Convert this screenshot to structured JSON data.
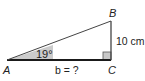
{
  "diagram": {
    "type": "right-triangle",
    "vertices": {
      "A": {
        "label": "A"
      },
      "B": {
        "label": "B"
      },
      "C": {
        "label": "C"
      }
    },
    "angle_A": "19°",
    "side_BC": "10 cm",
    "side_AC": "b = ?",
    "right_angle_at": "C",
    "colors": {
      "stroke": "#1a1a1a",
      "shade": "#c8c8c8",
      "right_angle_fill": "#c8c8c8"
    }
  }
}
